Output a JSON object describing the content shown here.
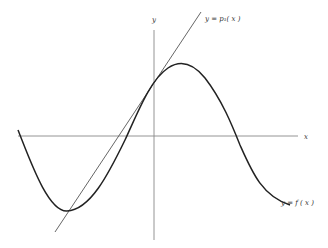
{
  "diagram": {
    "axes": {
      "x_label": "x",
      "y_label": "y"
    },
    "curves": [
      {
        "name": "f",
        "label": "y = f ( x )",
        "type": "smooth curve"
      },
      {
        "name": "p1",
        "label": "y = p₁( x )",
        "type": "straight tangent line"
      }
    ],
    "colors": {
      "curve": "#222222",
      "tangent": "#555555",
      "axes": "#777777"
    }
  }
}
